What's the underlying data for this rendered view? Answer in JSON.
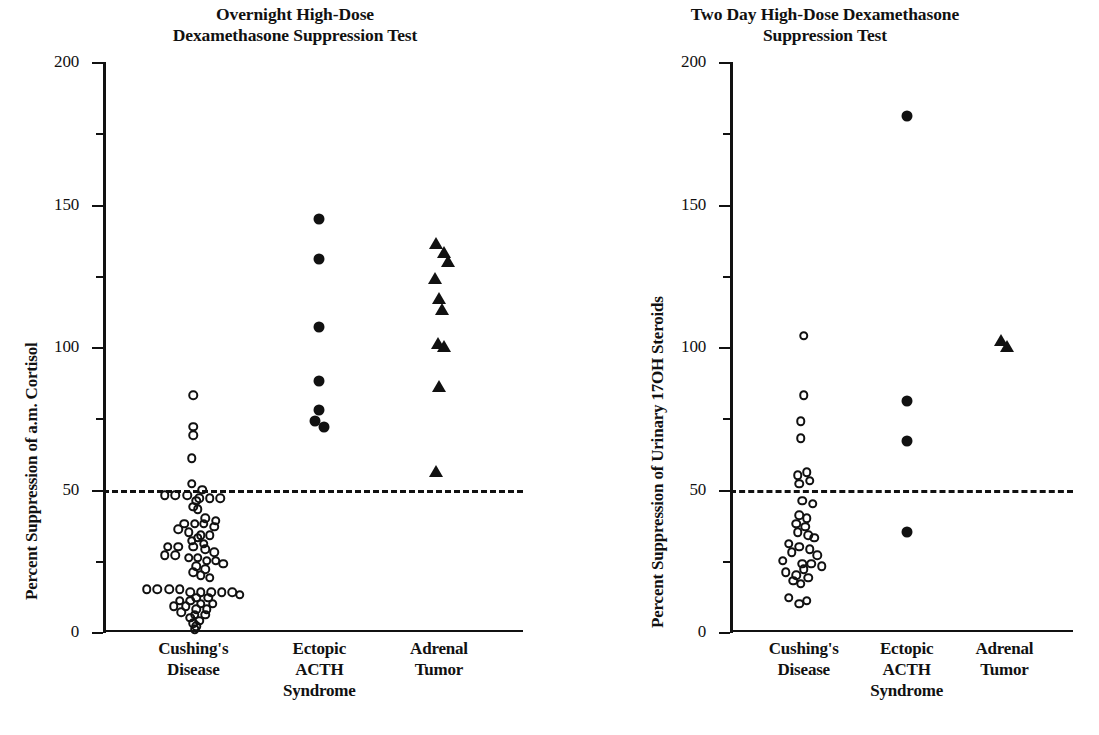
{
  "figure": {
    "background_color": "#ffffff",
    "ink_color": "#111111",
    "panels": [
      "left",
      "right"
    ]
  },
  "chart_data": [
    {
      "panel": "left",
      "type": "scatter",
      "title": "Overnight High-Dose Dexamethasone Suppression Test",
      "title_lines": [
        "Overnight High-Dose",
        "Dexamethasone Suppression Test"
      ],
      "xlabel": "",
      "ylabel": "Percent Suppression of a.m. Cortisol",
      "ylim": [
        0,
        200
      ],
      "grid": false,
      "legend": "none",
      "major_ticks": [
        0,
        50,
        100,
        150,
        200
      ],
      "minor_ticks": [
        25,
        75,
        125,
        175
      ],
      "tick_labels": [
        "0",
        "50",
        "100",
        "150",
        "200"
      ],
      "reference_line": {
        "value": 50,
        "style": "dashed",
        "label": ""
      },
      "categories": [
        "Cushing's Disease",
        "Ectopic ACTH Syndrome",
        "Adrenal Tumor"
      ],
      "category_lines": [
        [
          "Cushing's",
          "Disease"
        ],
        [
          "Ectopic",
          "ACTH",
          "Syndrome"
        ],
        [
          "Adrenal",
          "Tumor"
        ]
      ],
      "series": [
        {
          "name": "Cushing's Disease",
          "marker": "open-circle",
          "n": 73,
          "points": [
            {
              "v": 83,
              "j": 0.0
            },
            {
              "v": 72,
              "j": 0.0
            },
            {
              "v": 69,
              "j": 0.0
            },
            {
              "v": 61,
              "j": -0.01
            },
            {
              "v": 52,
              "j": -0.01
            },
            {
              "v": 50,
              "j": 0.06
            },
            {
              "v": 48,
              "j": -0.19
            },
            {
              "v": 48,
              "j": -0.12
            },
            {
              "v": 48,
              "j": -0.04
            },
            {
              "v": 47,
              "j": 0.04
            },
            {
              "v": 47,
              "j": 0.11
            },
            {
              "v": 47,
              "j": 0.18
            },
            {
              "v": 46,
              "j": 0.02
            },
            {
              "v": 44,
              "j": 0.0
            },
            {
              "v": 43,
              "j": 0.03
            },
            {
              "v": 40,
              "j": 0.08
            },
            {
              "v": 39,
              "j": 0.15
            },
            {
              "v": 38,
              "j": -0.06
            },
            {
              "v": 38,
              "j": 0.01
            },
            {
              "v": 38,
              "j": 0.07
            },
            {
              "v": 37,
              "j": 0.14
            },
            {
              "v": 36,
              "j": -0.1
            },
            {
              "v": 35,
              "j": -0.03
            },
            {
              "v": 34,
              "j": 0.05
            },
            {
              "v": 34,
              "j": 0.11
            },
            {
              "v": 33,
              "j": 0.03
            },
            {
              "v": 32,
              "j": -0.01
            },
            {
              "v": 31,
              "j": 0.07
            },
            {
              "v": 30,
              "j": -0.17
            },
            {
              "v": 30,
              "j": -0.1
            },
            {
              "v": 30,
              "j": 0.0
            },
            {
              "v": 29,
              "j": 0.08
            },
            {
              "v": 28,
              "j": 0.14
            },
            {
              "v": 27,
              "j": -0.19
            },
            {
              "v": 27,
              "j": -0.12
            },
            {
              "v": 26,
              "j": -0.03
            },
            {
              "v": 26,
              "j": 0.03
            },
            {
              "v": 25,
              "j": 0.09
            },
            {
              "v": 25,
              "j": 0.15
            },
            {
              "v": 24,
              "j": 0.2
            },
            {
              "v": 23,
              "j": 0.02
            },
            {
              "v": 22,
              "j": 0.08
            },
            {
              "v": 21,
              "j": 0.0
            },
            {
              "v": 20,
              "j": 0.05
            },
            {
              "v": 19,
              "j": 0.11
            },
            {
              "v": 15,
              "j": -0.31
            },
            {
              "v": 15,
              "j": -0.24
            },
            {
              "v": 15,
              "j": -0.16
            },
            {
              "v": 15,
              "j": -0.09
            },
            {
              "v": 14,
              "j": -0.02
            },
            {
              "v": 14,
              "j": 0.05
            },
            {
              "v": 14,
              "j": 0.12
            },
            {
              "v": 14,
              "j": 0.19
            },
            {
              "v": 14,
              "j": 0.26
            },
            {
              "v": 13,
              "j": 0.31
            },
            {
              "v": 12,
              "j": 0.02
            },
            {
              "v": 12,
              "j": 0.1
            },
            {
              "v": 11,
              "j": -0.09
            },
            {
              "v": 11,
              "j": -0.02
            },
            {
              "v": 10,
              "j": 0.05
            },
            {
              "v": 10,
              "j": 0.13
            },
            {
              "v": 9,
              "j": -0.13
            },
            {
              "v": 9,
              "j": -0.05
            },
            {
              "v": 8,
              "j": 0.02
            },
            {
              "v": 8,
              "j": 0.09
            },
            {
              "v": 7,
              "j": -0.08
            },
            {
              "v": 6,
              "j": 0.01
            },
            {
              "v": 6,
              "j": 0.08
            },
            {
              "v": 5,
              "j": -0.02
            },
            {
              "v": 4,
              "j": 0.04
            },
            {
              "v": 3,
              "j": 0.0
            },
            {
              "v": 2,
              "j": 0.02
            },
            {
              "v": 1,
              "j": 0.01
            }
          ]
        },
        {
          "name": "Ectopic ACTH Syndrome",
          "marker": "filled-circle",
          "n": 7,
          "points": [
            {
              "v": 145,
              "j": 0.0
            },
            {
              "v": 131,
              "j": 0.0
            },
            {
              "v": 107,
              "j": 0.0
            },
            {
              "v": 88,
              "j": 0.0
            },
            {
              "v": 78,
              "j": 0.0
            },
            {
              "v": 74,
              "j": -0.03
            },
            {
              "v": 72,
              "j": 0.03
            }
          ]
        },
        {
          "name": "Adrenal Tumor",
          "marker": "filled-triangle",
          "n": 10,
          "points": [
            {
              "v": 136,
              "j": -0.02
            },
            {
              "v": 133,
              "j": 0.03
            },
            {
              "v": 130,
              "j": 0.06
            },
            {
              "v": 124,
              "j": -0.03
            },
            {
              "v": 117,
              "j": 0.0
            },
            {
              "v": 113,
              "j": 0.02
            },
            {
              "v": 101,
              "j": -0.01
            },
            {
              "v": 100,
              "j": 0.03
            },
            {
              "v": 86,
              "j": 0.0
            },
            {
              "v": 56,
              "j": -0.02
            }
          ]
        }
      ]
    },
    {
      "panel": "right",
      "type": "scatter",
      "title": "Two Day High-Dose Dexamethasone Suppression Test",
      "title_lines": [
        "Two Day High-Dose Dexamethasone",
        "Suppression Test"
      ],
      "xlabel": "",
      "ylabel": "Percent Suppression of Urinary 17OH Steroids",
      "ylim": [
        0,
        200
      ],
      "grid": false,
      "legend": "none",
      "major_ticks": [
        0,
        50,
        100,
        150,
        200
      ],
      "minor_ticks": [
        25,
        75,
        125,
        175
      ],
      "tick_labels": [
        "0",
        "50",
        "100",
        "150",
        "200"
      ],
      "reference_line": {
        "value": 50,
        "style": "dashed",
        "label": ""
      },
      "categories": [
        "Cushing's Disease",
        "Ectopic ACTH Syndrome",
        "Adrenal Tumor"
      ],
      "category_lines": [
        [
          "Cushing's",
          "Disease"
        ],
        [
          "Ectopic",
          "ACTH",
          "Syndrome"
        ],
        [
          "Adrenal",
          "Tumor"
        ]
      ],
      "series": [
        {
          "name": "Cushing's Disease",
          "marker": "open-circle",
          "n": 35,
          "points": [
            {
              "v": 104,
              "j": 0.0
            },
            {
              "v": 83,
              "j": 0.0
            },
            {
              "v": 74,
              "j": -0.02
            },
            {
              "v": 68,
              "j": -0.02
            },
            {
              "v": 56,
              "j": 0.02
            },
            {
              "v": 55,
              "j": -0.04
            },
            {
              "v": 53,
              "j": 0.04
            },
            {
              "v": 52,
              "j": -0.03
            },
            {
              "v": 46,
              "j": -0.01
            },
            {
              "v": 45,
              "j": 0.06
            },
            {
              "v": 41,
              "j": -0.03
            },
            {
              "v": 40,
              "j": 0.02
            },
            {
              "v": 38,
              "j": -0.05
            },
            {
              "v": 37,
              "j": 0.01
            },
            {
              "v": 35,
              "j": -0.04
            },
            {
              "v": 34,
              "j": 0.03
            },
            {
              "v": 33,
              "j": 0.07
            },
            {
              "v": 31,
              "j": -0.1
            },
            {
              "v": 30,
              "j": -0.03
            },
            {
              "v": 29,
              "j": 0.04
            },
            {
              "v": 28,
              "j": -0.08
            },
            {
              "v": 27,
              "j": 0.09
            },
            {
              "v": 25,
              "j": -0.14
            },
            {
              "v": 24,
              "j": -0.01
            },
            {
              "v": 24,
              "j": 0.05
            },
            {
              "v": 23,
              "j": 0.12
            },
            {
              "v": 22,
              "j": 0.0
            },
            {
              "v": 21,
              "j": -0.12
            },
            {
              "v": 20,
              "j": -0.05
            },
            {
              "v": 19,
              "j": 0.03
            },
            {
              "v": 18,
              "j": -0.07
            },
            {
              "v": 17,
              "j": -0.02
            },
            {
              "v": 12,
              "j": -0.1
            },
            {
              "v": 11,
              "j": 0.02
            },
            {
              "v": 10,
              "j": -0.03
            }
          ]
        },
        {
          "name": "Ectopic ACTH Syndrome",
          "marker": "filled-circle",
          "n": 4,
          "points": [
            {
              "v": 181,
              "j": 0.0
            },
            {
              "v": 81,
              "j": 0.0
            },
            {
              "v": 67,
              "j": 0.0
            },
            {
              "v": 35,
              "j": 0.0
            }
          ]
        },
        {
          "name": "Adrenal Tumor",
          "marker": "filled-triangle",
          "n": 2,
          "points": [
            {
              "v": 102,
              "j": -0.02
            },
            {
              "v": 100,
              "j": 0.02
            }
          ]
        }
      ]
    }
  ]
}
